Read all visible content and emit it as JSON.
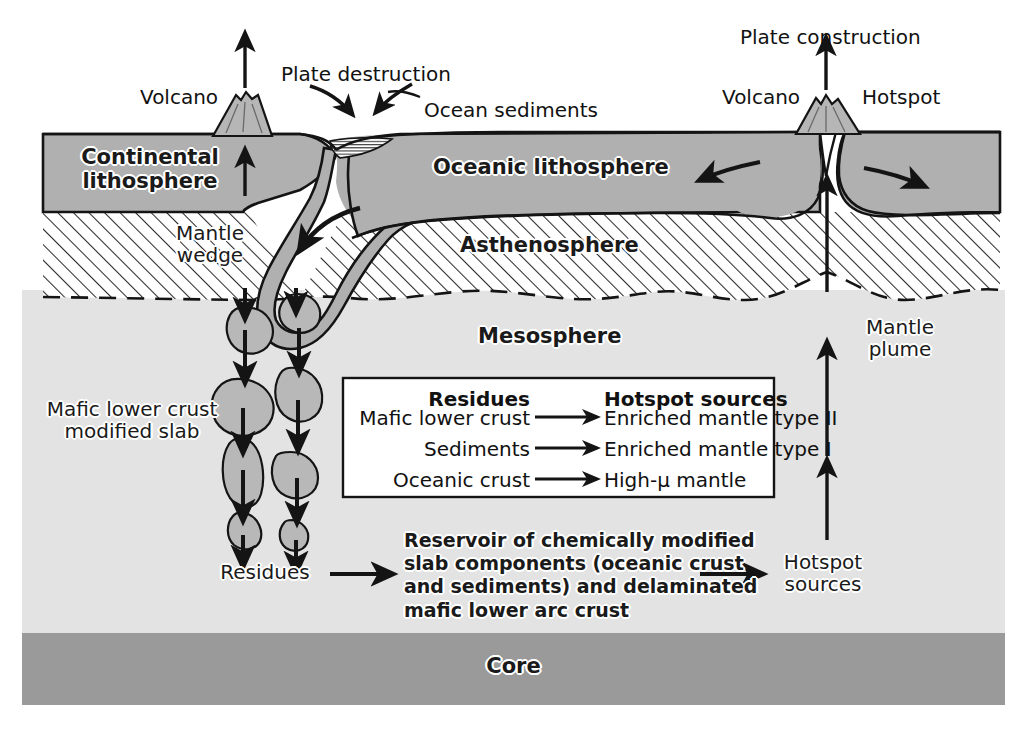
{
  "figure": {
    "type": "diagram"
  },
  "layers": [
    {
      "id": "continental-lithosphere",
      "label": "Continental\nlithosphere",
      "color": "#b0b0b0"
    },
    {
      "id": "oceanic-lithosphere",
      "label": "Oceanic lithosphere",
      "color": "#b0b0b0"
    },
    {
      "id": "asthenosphere",
      "label": "Asthenosphere",
      "color": "#ffffff"
    },
    {
      "id": "mesosphere",
      "label": "Mesosphere",
      "color": "#e3e3e3"
    },
    {
      "id": "core",
      "label": "Core",
      "color": "#9a9a9a"
    }
  ],
  "annotations": {
    "volcano_left": "Volcano",
    "volcano_right": "Volcano",
    "plate_destruction": "Plate destruction",
    "plate_construction": "Plate construction",
    "ocean_sediments": "Ocean sediments",
    "hotspot": "Hotspot",
    "mantle_wedge": "Mantle\nwedge",
    "mafic_lower_crust": "Mafic lower crust\nmodified slab",
    "residues": "Residues",
    "mantle_plume": "Mantle\nplume",
    "hotspot_sources": "Hotspot\nsources",
    "reservoir": "Reservoir of chemically modified\nslab components (oceanic crust\nand sediments) and delaminated\nmafic lower arc crust"
  },
  "legend": {
    "headers": {
      "left": "Residues",
      "right": "Hotspot sources"
    },
    "rows": [
      {
        "source": "Mafic lower crust",
        "arrow": "⟶",
        "result": "Enriched mantle type II"
      },
      {
        "source": "Sediments",
        "arrow": "⟶",
        "result": "Enriched mantle type I"
      },
      {
        "source": "Oceanic crust",
        "arrow": "⟶",
        "result": "High-μ mantle"
      }
    ]
  },
  "colors": {
    "lithosphere_fill": "#b0b0b0",
    "mesosphere_fill": "#e3e3e3",
    "core_fill": "#9a9a9a",
    "slab_fill": "#b0b0b0",
    "blob_fill": "#b8b8b8",
    "line": "#141414",
    "background": "#ffffff",
    "legend_box": "#ffffff"
  }
}
